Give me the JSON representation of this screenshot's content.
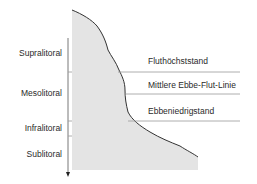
{
  "diagram": {
    "type": "coastal-zonation-profile",
    "colors": {
      "fill": "#e4e4e4",
      "outline": "#333333",
      "lines": "#9a9a9a",
      "axis": "#555555",
      "text": "#2a2a2a"
    },
    "zones": [
      {
        "label": "Supralitoral"
      },
      {
        "label": "Mesolitoral"
      },
      {
        "label": "Infralitoral"
      },
      {
        "label": "Sublitoral"
      }
    ],
    "levels": [
      {
        "label": "Fluthöchststand"
      },
      {
        "label": "Mittlere Ebbe-Flut-Linie"
      },
      {
        "label": "Ebbeniedrigstand"
      }
    ]
  }
}
